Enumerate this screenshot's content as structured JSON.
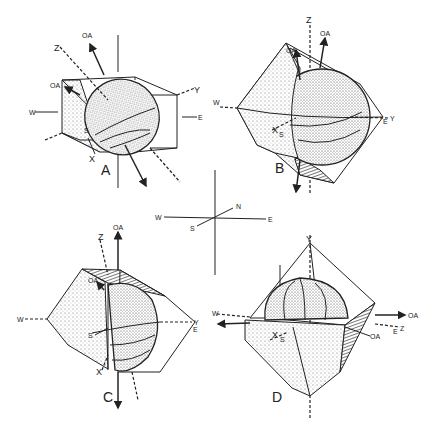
{
  "figure": {
    "compass": {
      "N": "N",
      "S": "S",
      "E": "E",
      "W": "W"
    },
    "panels": [
      {
        "id": "A",
        "label": "A",
        "axes": {
          "z": "Z",
          "y": "Y",
          "x": "X",
          "s": "S",
          "oa1": "OA",
          "oa2": "OA",
          "w": "W",
          "e": "E"
        }
      },
      {
        "id": "B",
        "label": "B",
        "axes": {
          "z": "Z",
          "y": "Y",
          "x": "X",
          "s": "S",
          "oa1": "OA",
          "oa2": "OA",
          "w": "W",
          "e": "E"
        }
      },
      {
        "id": "C",
        "label": "C",
        "axes": {
          "z": "Z",
          "y": "Y",
          "x": "X",
          "s": "S",
          "oa1": "OA",
          "oa2": "OA",
          "w": "W",
          "e": "E"
        }
      },
      {
        "id": "D",
        "label": "D",
        "axes": {
          "z": "Z",
          "y": "Y",
          "x": "X",
          "s": "S",
          "oa1": "OA",
          "oa2": "OA",
          "w": "W",
          "e": "E"
        }
      }
    ]
  }
}
